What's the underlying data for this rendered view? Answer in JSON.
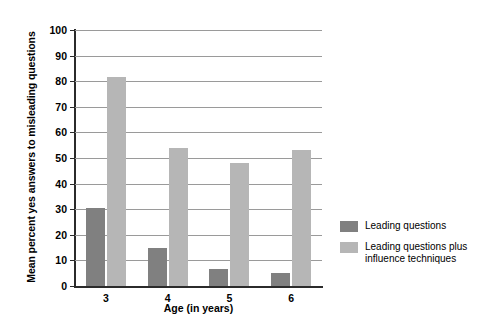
{
  "chart_data": {
    "type": "bar",
    "title": "",
    "xlabel": "Age (in years)",
    "ylabel": "Mean percent yes answers to misleading questions",
    "categories": [
      "3",
      "4",
      "5",
      "6"
    ],
    "ylim": [
      0,
      100
    ],
    "yticks": [
      "0",
      "10",
      "20",
      "30",
      "40",
      "50",
      "60",
      "70",
      "80",
      "90",
      "100"
    ],
    "grid": true,
    "legend_position": "right",
    "series": [
      {
        "name": "Leading questions",
        "color": "#808080",
        "values": [
          30.5,
          15,
          6.5,
          5
        ]
      },
      {
        "name": "Leading questions plus influence techniques",
        "color": "#b6b6b6",
        "values": [
          81.5,
          54,
          48,
          53
        ]
      }
    ]
  },
  "legend": {
    "entries": [
      {
        "label": "Leading questions"
      },
      {
        "label": "Leading questions plus\ninfluence techniques"
      }
    ]
  }
}
